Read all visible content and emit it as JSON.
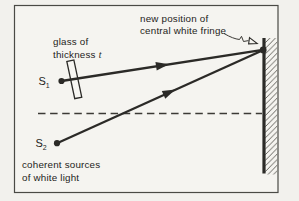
{
  "figure": {
    "annotations": {
      "new_position_line1": "new position of",
      "new_position_line2": "central white fringe",
      "glass_line1": "glass of",
      "glass_line2_word": "thickness",
      "glass_symbol": "t",
      "sources_line1": "coherent sources",
      "sources_line2": "of white light"
    },
    "sources": {
      "s1_base": "S",
      "s1_sub": "1",
      "s2_base": "S",
      "s2_sub": "2"
    },
    "colors": {
      "paper": "#f2f1ed",
      "ink": "#2b2a27",
      "hatch": "#55534e"
    }
  }
}
